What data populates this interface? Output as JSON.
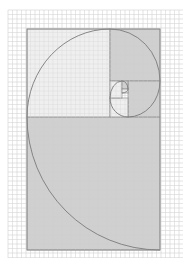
{
  "diagram": {
    "type": "golden-rectangle-spiral",
    "colors": {
      "background": "#ffffff",
      "grid": "#d8d8d8",
      "shaded": "#c8c8c8",
      "unshaded": "#ececec",
      "lines": "#8a8a8a",
      "spiral": "#7a7a7a"
    },
    "grid": {
      "spacing": 4.5,
      "x0": 8,
      "y0": 10,
      "x1": 183,
      "y1": 258
    },
    "rect": {
      "x": 27,
      "y": 29,
      "w": 133,
      "h": 221
    },
    "squares": [
      {
        "x": 27,
        "y": 117,
        "w": 133,
        "h": 133,
        "shade": "shaded"
      },
      {
        "x": 27,
        "y": 29,
        "w": 83,
        "h": 88,
        "shade": "unshaded"
      },
      {
        "x": 110,
        "y": 29,
        "w": 50,
        "h": 52,
        "shade": "shaded"
      },
      {
        "x": 128,
        "y": 81,
        "w": 32,
        "h": 36,
        "shade": "shaded"
      },
      {
        "x": 110,
        "y": 98,
        "w": 18,
        "h": 19,
        "shade": "unshaded"
      },
      {
        "x": 110,
        "y": 81,
        "w": 12,
        "h": 17,
        "shade": "unshaded"
      },
      {
        "x": 122,
        "y": 81,
        "w": 6,
        "h": 8,
        "shade": "shaded"
      },
      {
        "x": 122,
        "y": 89,
        "w": 6,
        "h": 4,
        "shade": "unshaded"
      }
    ]
  }
}
